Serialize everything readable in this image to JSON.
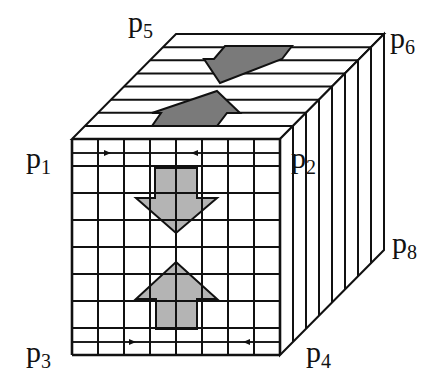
{
  "diagram": {
    "colors": {
      "line": "#111111",
      "front_arrow_fill": "#b4b4b4",
      "top_arrow_fill": "#7a7a7a",
      "background": "#ffffff"
    },
    "cube": {
      "front": {
        "x": 72,
        "y": 139,
        "cols": 8,
        "rows": 8,
        "cell_w": 26,
        "cell_h": 27
      },
      "depth": {
        "dx": 104,
        "dy": -105,
        "strips": 8
      }
    },
    "labels": [
      {
        "id": "p1",
        "base": "p",
        "sub": "1",
        "x": 26,
        "y": 168
      },
      {
        "id": "p2",
        "base": "p",
        "sub": "2",
        "x": 291,
        "y": 168
      },
      {
        "id": "p3",
        "base": "p",
        "sub": "3",
        "x": 26,
        "y": 362
      },
      {
        "id": "p4",
        "base": "p",
        "sub": "4",
        "x": 306,
        "y": 362
      },
      {
        "id": "p5",
        "base": "p",
        "sub": "5",
        "x": 128,
        "y": 32
      },
      {
        "id": "p6",
        "base": "p",
        "sub": "6",
        "x": 390,
        "y": 48
      },
      {
        "id": "p8",
        "base": "p",
        "sub": "8",
        "x": 392,
        "y": 253
      }
    ],
    "arrows": {
      "front_down": {
        "points": "155,168 197,168 197,198 217,198 176,233 136,198 155,198"
      },
      "front_up": {
        "points": "176,262 217,299 197,299 197,329 156,329 156,299 136,299"
      },
      "top_back": {
        "points": "225,46 292,46 282,59 220,83 204,59 214,59"
      },
      "top_front": {
        "points": "217,91 240,113 227,113 217,126 152,126 161,113 152,113"
      }
    },
    "row_markers": [
      {
        "name": "p1-row-arrow",
        "x1": 74,
        "x2": 111,
        "y": 153,
        "dir": "right"
      },
      {
        "name": "p2-row-arrow",
        "x1": 278,
        "x2": 191,
        "y": 153,
        "dir": "left"
      },
      {
        "name": "p3-row-arrow",
        "x1": 74,
        "x2": 136,
        "y": 342,
        "dir": "right"
      },
      {
        "name": "p4-row-arrow",
        "x1": 278,
        "x2": 243,
        "y": 342,
        "dir": "left"
      }
    ]
  }
}
